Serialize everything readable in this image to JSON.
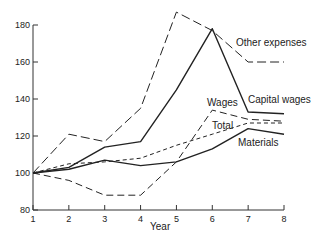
{
  "chart_data": {
    "type": "line",
    "title": "",
    "xlabel": "Year",
    "ylabel": "",
    "x": [
      1,
      2,
      3,
      4,
      5,
      6,
      7,
      8
    ],
    "xticks": [
      "1",
      "2",
      "3",
      "4",
      "5",
      "6",
      "7",
      "8"
    ],
    "yticks": [
      "80",
      "100",
      "120",
      "140",
      "160",
      "180"
    ],
    "ylim": [
      80,
      190
    ],
    "xlim": [
      1,
      8
    ],
    "grid": false,
    "legend": "inline labels",
    "series": [
      {
        "name": "Other expenses",
        "style": "long-dash",
        "values": [
          100,
          121,
          117,
          135,
          187,
          177,
          160,
          160
        ]
      },
      {
        "name": "Capital wages",
        "style": "solid",
        "values": [
          100,
          103,
          114,
          117,
          145,
          178,
          133,
          132
        ]
      },
      {
        "name": "Wages",
        "style": "dash",
        "values": [
          100,
          96,
          88,
          88,
          106,
          134,
          129,
          128
        ]
      },
      {
        "name": "Total",
        "style": "short-dash",
        "values": [
          100,
          105,
          106,
          108,
          115,
          121,
          127,
          127
        ]
      },
      {
        "name": "Materials",
        "style": "solid",
        "values": [
          100,
          102,
          107,
          104,
          106,
          113,
          124,
          121
        ]
      }
    ]
  },
  "labels": {
    "other_expenses": "Other expenses",
    "capital_wages": "Capital wages",
    "wages": "Wages",
    "total": "Total",
    "materials": "Materials",
    "year": "Year"
  }
}
